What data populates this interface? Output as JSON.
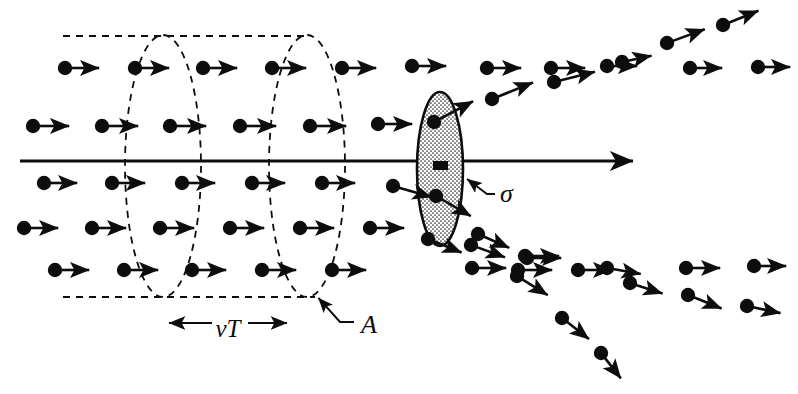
{
  "figure": {
    "type": "physics-scattering-diagram",
    "width": 798,
    "height": 394,
    "background_color": "#ffffff",
    "ink_color": "#0d0d0d"
  },
  "labels": {
    "cross_section": "σ",
    "cylinder_length": "vT",
    "cylinder_area": "A"
  },
  "label_positions": {
    "cross_section": {
      "x": 500,
      "y": 196
    },
    "cylinder_length": {
      "x": 228,
      "y": 331
    },
    "cylinder_area": {
      "x": 361,
      "y": 327
    }
  },
  "axis": {
    "x1": 20,
    "y1": 161,
    "x2": 645,
    "y2": 161,
    "stroke_width": 3.2,
    "arrowhead": true
  },
  "cylinder": {
    "left_ellipse": {
      "cx": 163,
      "cy": 166,
      "rx": 38,
      "ry": 131
    },
    "right_ellipse": {
      "cx": 307,
      "cy": 166,
      "rx": 38,
      "ry": 131
    },
    "top_line": {
      "x1": 63,
      "y1": 36,
      "x2": 310,
      "y2": 36
    },
    "bottom_line": {
      "x1": 63,
      "y1": 297,
      "x2": 315,
      "y2": 297
    },
    "dash_pattern": "7,6",
    "stroke_width": 1.8
  },
  "target": {
    "cx": 440,
    "cy": 169,
    "rx": 23,
    "ry": 77,
    "fill_pattern": "stipple",
    "stroke_width": 2.6,
    "center_marker": {
      "x": 433,
      "y": 161,
      "w": 15,
      "h": 9
    }
  },
  "sigma_leader": {
    "tip": {
      "x": 463,
      "y": 176
    },
    "elbow": {
      "x": 487,
      "y": 194
    },
    "tail": {
      "x": 495,
      "y": 194
    }
  },
  "area_leader": {
    "tip": {
      "x": 314,
      "y": 293
    },
    "elbow": {
      "x": 340,
      "y": 322
    },
    "tail": {
      "x": 354,
      "y": 322
    }
  },
  "vt_arrow": {
    "x1": 160,
    "y1": 323,
    "x2": 296,
    "y2": 323,
    "gap_left": 212,
    "gap_right": 248
  },
  "particle_radius": 7.2,
  "arrow_stroke": 2.6,
  "incoming_particles": [
    {
      "x": 65,
      "y": 68,
      "len": 34,
      "angle": 0
    },
    {
      "x": 135,
      "y": 68,
      "len": 34,
      "angle": 0
    },
    {
      "x": 203,
      "y": 68,
      "len": 34,
      "angle": 0
    },
    {
      "x": 272,
      "y": 68,
      "len": 34,
      "angle": 0
    },
    {
      "x": 342,
      "y": 68,
      "len": 34,
      "angle": 0
    },
    {
      "x": 412,
      "y": 66,
      "len": 34,
      "angle": 0
    },
    {
      "x": 33,
      "y": 126,
      "len": 36,
      "angle": 0
    },
    {
      "x": 102,
      "y": 126,
      "len": 36,
      "angle": 0
    },
    {
      "x": 170,
      "y": 126,
      "len": 36,
      "angle": 0
    },
    {
      "x": 240,
      "y": 126,
      "len": 36,
      "angle": 0
    },
    {
      "x": 310,
      "y": 126,
      "len": 36,
      "angle": 0
    },
    {
      "x": 378,
      "y": 124,
      "len": 34,
      "angle": 0
    },
    {
      "x": 44,
      "y": 183,
      "len": 33,
      "angle": 0
    },
    {
      "x": 112,
      "y": 183,
      "len": 33,
      "angle": 0
    },
    {
      "x": 182,
      "y": 183,
      "len": 33,
      "angle": 0
    },
    {
      "x": 252,
      "y": 183,
      "len": 33,
      "angle": 0
    },
    {
      "x": 322,
      "y": 183,
      "len": 33,
      "angle": 0
    },
    {
      "x": 24,
      "y": 228,
      "len": 34,
      "angle": 0
    },
    {
      "x": 92,
      "y": 228,
      "len": 34,
      "angle": 0
    },
    {
      "x": 160,
      "y": 228,
      "len": 34,
      "angle": 0
    },
    {
      "x": 230,
      "y": 228,
      "len": 34,
      "angle": 0
    },
    {
      "x": 300,
      "y": 228,
      "len": 34,
      "angle": 0
    },
    {
      "x": 370,
      "y": 228,
      "len": 34,
      "angle": 0
    },
    {
      "x": 55,
      "y": 270,
      "len": 34,
      "angle": 0
    },
    {
      "x": 124,
      "y": 270,
      "len": 34,
      "angle": 0
    },
    {
      "x": 192,
      "y": 270,
      "len": 34,
      "angle": 0
    },
    {
      "x": 262,
      "y": 270,
      "len": 34,
      "angle": 0
    },
    {
      "x": 332,
      "y": 270,
      "len": 34,
      "angle": 0
    }
  ],
  "target_particles": [
    {
      "x": 434,
      "y": 122,
      "len": 44,
      "angle": -28
    },
    {
      "x": 436,
      "y": 196,
      "len": 40,
      "angle": 30
    },
    {
      "x": 428,
      "y": 239,
      "len": 36,
      "angle": 22
    },
    {
      "x": 393,
      "y": 186,
      "len": 40,
      "angle": 16
    }
  ],
  "scattered_upper": [
    {
      "x": 492,
      "y": 99,
      "len": 44,
      "angle": -22
    },
    {
      "x": 487,
      "y": 68,
      "len": 34,
      "angle": 0
    },
    {
      "x": 551,
      "y": 68,
      "len": 34,
      "angle": 0
    },
    {
      "x": 554,
      "y": 82,
      "len": 42,
      "angle": -14
    },
    {
      "x": 607,
      "y": 66,
      "len": 30,
      "angle": 0
    },
    {
      "x": 622,
      "y": 62,
      "len": 30,
      "angle": -12
    },
    {
      "x": 667,
      "y": 43,
      "len": 40,
      "angle": -20
    },
    {
      "x": 690,
      "y": 68,
      "len": 32,
      "angle": 0
    },
    {
      "x": 758,
      "y": 67,
      "len": 32,
      "angle": 0
    },
    {
      "x": 723,
      "y": 25,
      "len": 38,
      "angle": -22
    }
  ],
  "scattered_lower": [
    {
      "x": 478,
      "y": 234,
      "len": 34,
      "angle": 24
    },
    {
      "x": 471,
      "y": 245,
      "len": 36,
      "angle": 20
    },
    {
      "x": 472,
      "y": 268,
      "len": 34,
      "angle": 0
    },
    {
      "x": 527,
      "y": 258,
      "len": 34,
      "angle": 0
    },
    {
      "x": 525,
      "y": 256,
      "len": 34,
      "angle": 0
    },
    {
      "x": 518,
      "y": 270,
      "len": 34,
      "angle": 0
    },
    {
      "x": 517,
      "y": 276,
      "len": 36,
      "angle": 32
    },
    {
      "x": 578,
      "y": 270,
      "len": 34,
      "angle": 0
    },
    {
      "x": 607,
      "y": 268,
      "len": 34,
      "angle": 10
    },
    {
      "x": 630,
      "y": 283,
      "len": 34,
      "angle": 18
    },
    {
      "x": 562,
      "y": 318,
      "len": 34,
      "angle": 38
    },
    {
      "x": 601,
      "y": 353,
      "len": 32,
      "angle": 52
    },
    {
      "x": 686,
      "y": 268,
      "len": 34,
      "angle": 0
    },
    {
      "x": 688,
      "y": 295,
      "len": 36,
      "angle": 22
    },
    {
      "x": 754,
      "y": 266,
      "len": 32,
      "angle": 0
    },
    {
      "x": 747,
      "y": 306,
      "len": 34,
      "angle": 12
    }
  ]
}
